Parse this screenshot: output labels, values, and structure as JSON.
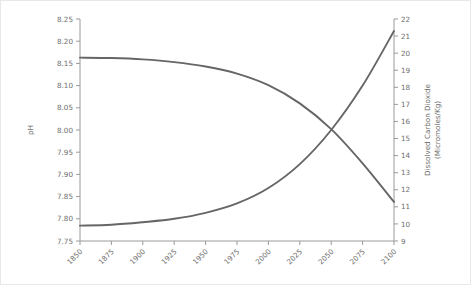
{
  "chart_data": {
    "type": "line",
    "title": "",
    "subtitle": "",
    "xlabel": "",
    "ylabel": "pH",
    "y2label_line1": "Dissolved Carbon Dioxide",
    "y2label_line2": "(Micromoles/Kg)",
    "grid": false,
    "legend": "none",
    "line_color": "#666666",
    "axis_color": "#9a9a9a",
    "text_color": "#6e6e6e",
    "background": "#ffffff",
    "xlim": [
      1850,
      2100
    ],
    "x_ticks": [
      1850,
      1875,
      1900,
      1925,
      1950,
      1975,
      2000,
      2025,
      2050,
      2075,
      2100
    ],
    "x_tick_labels": [
      "1850",
      "1875",
      "1900",
      "1925",
      "1950",
      "1975",
      "2000",
      "2025",
      "2050",
      "2075",
      "2100"
    ],
    "x_tick_rotation": 45,
    "ylim": [
      7.75,
      8.25
    ],
    "y_ticks": [
      7.75,
      7.8,
      7.85,
      7.9,
      7.95,
      8.0,
      8.05,
      8.1,
      8.15,
      8.2,
      8.25
    ],
    "y_tick_labels": [
      "7.75",
      "7.80",
      "7.85",
      "7.90",
      "7.95",
      "8.00",
      "8.05",
      "8.10",
      "8.15",
      "8.20",
      "8.25"
    ],
    "y2lim": [
      9,
      22
    ],
    "y2_ticks": [
      9,
      10,
      11,
      12,
      13,
      14,
      15,
      16,
      17,
      18,
      19,
      20,
      21,
      22
    ],
    "y2_tick_labels": [
      "9",
      "10",
      "11",
      "12",
      "13",
      "14",
      "15",
      "16",
      "17",
      "18",
      "19",
      "20",
      "21",
      "22"
    ],
    "crossing_year": 2040,
    "series": [
      {
        "name": "pH",
        "axis": "left",
        "x": [
          1850,
          1875,
          1900,
          1925,
          1950,
          1975,
          2000,
          2025,
          2050,
          2075,
          2100
        ],
        "values": [
          8.163,
          8.162,
          8.159,
          8.153,
          8.143,
          8.127,
          8.101,
          8.06,
          8.002,
          7.925,
          7.838
        ]
      },
      {
        "name": "Dissolved Carbon Dioxide",
        "axis": "right",
        "x": [
          1850,
          1875,
          1900,
          1925,
          1950,
          1975,
          2000,
          2025,
          2050,
          2075,
          2100
        ],
        "values": [
          9.9,
          9.95,
          10.1,
          10.3,
          10.65,
          11.2,
          12.1,
          13.5,
          15.5,
          18.1,
          21.3
        ]
      }
    ]
  }
}
